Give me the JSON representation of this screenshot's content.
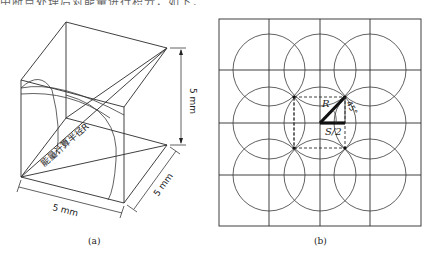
{
  "header_fragment": "中断点处理后对能量进行积分，如下：",
  "panel_a": {
    "caption": "(a)",
    "width_label": "5 mm",
    "depth_label": "5 mm",
    "height_label": "5 mm",
    "radius_label": "能量计算半径R"
  },
  "panel_b": {
    "caption": "(b)",
    "r_label": "R",
    "angle_label": "45°",
    "half_spacing_label": "S/2",
    "grid": {
      "columns": 4,
      "rows": 4
    },
    "circles": {
      "rows": 3,
      "columns": 3
    }
  }
}
